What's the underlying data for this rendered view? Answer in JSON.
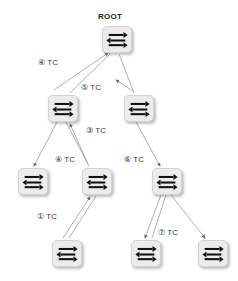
{
  "diagram": {
    "title": "ROOT",
    "icon_name": "network-switch-icon",
    "nodes": [
      {
        "id": "root",
        "label": "ROOT",
        "x": 102,
        "y": 26,
        "level": 0
      },
      {
        "id": "n1",
        "label": "",
        "x": 48,
        "y": 95,
        "level": 1
      },
      {
        "id": "n2",
        "label": "",
        "x": 124,
        "y": 95,
        "level": 1
      },
      {
        "id": "n3",
        "label": "",
        "x": 18,
        "y": 168,
        "level": 2
      },
      {
        "id": "n4",
        "label": "",
        "x": 82,
        "y": 168,
        "level": 2
      },
      {
        "id": "n5",
        "label": "",
        "x": 152,
        "y": 168,
        "level": 2
      },
      {
        "id": "n6",
        "label": "",
        "x": 52,
        "y": 240,
        "level": 3
      },
      {
        "id": "n7",
        "label": "",
        "x": 131,
        "y": 240,
        "level": 3
      },
      {
        "id": "n8",
        "label": "",
        "x": 198,
        "y": 240,
        "level": 3
      }
    ],
    "edges": [
      {
        "id": "e1",
        "from": "n1",
        "to": "root",
        "label": "④ TC",
        "label_x": 38,
        "label_y": 58
      },
      {
        "id": "e2",
        "from": "n2",
        "to": "root",
        "label": "⑤ TC",
        "label_x": 81,
        "label_y": 83
      },
      {
        "id": "e3",
        "from": "n4",
        "to": "n1",
        "label": "③ TC",
        "label_x": 86,
        "label_y": 126
      },
      {
        "id": "e4",
        "from": "n1",
        "to": "n3",
        "label": "④ TC",
        "label_x": 55,
        "label_y": 155
      },
      {
        "id": "e5",
        "from": "n2",
        "to": "n5",
        "label": "⑥ TC",
        "label_x": 124,
        "label_y": 155
      },
      {
        "id": "e6",
        "from": "n6",
        "to": "n4",
        "label": "① TC",
        "label_x": 37,
        "label_y": 212
      },
      {
        "id": "e7",
        "from": "n5",
        "to": "n7",
        "label": "⑦ TC",
        "label_x": 158,
        "label_y": 228
      }
    ],
    "colors": {
      "node_fill": "#ececec",
      "node_border": "#d2d2d2",
      "edge_line": "#9a9a9a",
      "icon": "#111111",
      "text": "#1a1a1a"
    }
  }
}
